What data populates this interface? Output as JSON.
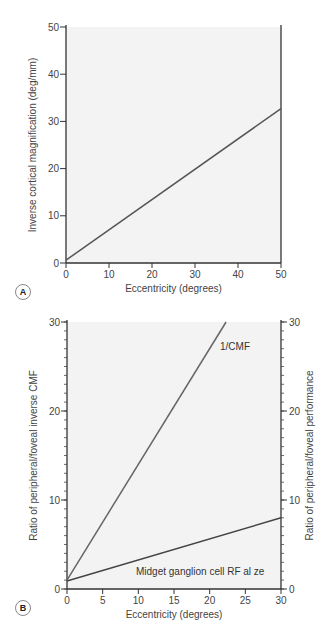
{
  "panels": {
    "a": {
      "label": "A"
    },
    "b": {
      "label": "B"
    }
  },
  "chart_data": [
    {
      "id": "A",
      "type": "line",
      "title": "",
      "xlabel": "Eccentricity (degrees)",
      "ylabel": "Inverse cortical magnification (deg/mm)",
      "xlim": [
        0,
        50
      ],
      "ylim": [
        0,
        50
      ],
      "xticks": [
        0,
        10,
        20,
        30,
        40,
        50
      ],
      "yticks": [
        0,
        10,
        20,
        30,
        40,
        50
      ],
      "grid": false,
      "background": "#f3f3f3",
      "series": [
        {
          "name": "1/CMF",
          "x": [
            0,
            50
          ],
          "y": [
            0.6,
            32.7
          ],
          "color": "#555555"
        }
      ]
    },
    {
      "id": "B",
      "type": "line",
      "title": "",
      "xlabel": "Eccentricity (degrees)",
      "ylabel": "Ratio of peripheral/foveal inverse CMF",
      "ylabel_right": "Ratio of peripheral/foveal performance",
      "xlim": [
        0,
        30
      ],
      "ylim": [
        0,
        30
      ],
      "xticks": [
        0,
        5,
        10,
        15,
        20,
        25,
        30
      ],
      "yticks": [
        0,
        10,
        20,
        30
      ],
      "yticks_right": [
        0,
        10,
        20,
        30
      ],
      "minor_yticks_step": 1,
      "grid": false,
      "background": "#f3f3f3",
      "series": [
        {
          "name": "1/CMF",
          "label": "1/CMF",
          "x": [
            0,
            22.3
          ],
          "y": [
            1.0,
            30.0
          ],
          "color": "#666666"
        },
        {
          "name": "Midget ganglion cell RF size",
          "label": "Midget ganglion cell RF al ze",
          "x": [
            0,
            30
          ],
          "y": [
            0.9,
            8.0
          ],
          "color": "#444444"
        }
      ]
    }
  ]
}
